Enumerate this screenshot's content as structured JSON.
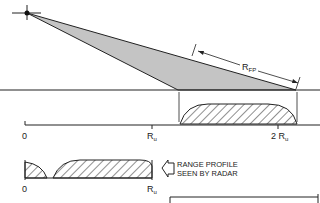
{
  "diagram": {
    "labels": {
      "footprint": "R",
      "footprint_sub": "FP",
      "axis_zero": "0",
      "axis_ru": "R",
      "axis_ru_sub": "u",
      "axis_2ru": "2 R",
      "axis_2ru_sub": "u",
      "lower_zero": "0",
      "lower_ru": "R",
      "lower_ru_sub": "u",
      "caption_line1": "RANGE PROFILE",
      "caption_line2": "SEEN BY RADAR"
    },
    "colors": {
      "ink": "#222222",
      "beam_fill": "#c4c4c4",
      "background": "#ffffff"
    },
    "icons": {
      "radar": "radar-star-icon",
      "arrow": "hollow-left-arrow-icon"
    }
  }
}
